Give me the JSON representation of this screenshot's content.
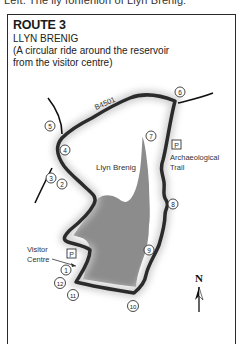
{
  "header": {
    "cut_off_text": "Left. The lly fonfenion of Llyn Brenig:"
  },
  "route": {
    "title": "ROUTE 3",
    "name": "LLYN BRENIG",
    "description_line1": "(A circular ride around the reservoir",
    "description_line2": "from the visitor centre)"
  },
  "map": {
    "road_label": "B4501",
    "lake_label": "Llyn Brenig",
    "parking_symbol": "P",
    "archaeological_trail_line1": "Archaeological",
    "archaeological_trail_line2": "Trail",
    "visitor_centre_line1": "Visitor",
    "visitor_centre_line2": "Centre",
    "north_label": "N",
    "markers": [
      {
        "n": "1",
        "x": 66,
        "y": 270
      },
      {
        "n": "2",
        "x": 62,
        "y": 184
      },
      {
        "n": "3",
        "x": 51,
        "y": 178
      },
      {
        "n": "4",
        "x": 65,
        "y": 150
      },
      {
        "n": "5",
        "x": 50,
        "y": 126
      },
      {
        "n": "6",
        "x": 180,
        "y": 92
      },
      {
        "n": "7",
        "x": 151,
        "y": 136
      },
      {
        "n": "8",
        "x": 173,
        "y": 204
      },
      {
        "n": "9",
        "x": 149,
        "y": 250
      },
      {
        "n": "10",
        "x": 133,
        "y": 306
      },
      {
        "n": "11",
        "x": 73,
        "y": 295
      },
      {
        "n": "12",
        "x": 60,
        "y": 283
      }
    ],
    "colors": {
      "route": "#2b2b2b",
      "lake": "#8c8c8c",
      "road": "#111111",
      "glow": "#d0d0d0"
    }
  }
}
